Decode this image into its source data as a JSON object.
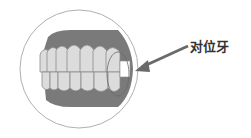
{
  "diagram": {
    "label": "对位牙",
    "colors": {
      "gum": "#7a7a7a",
      "tooth": "#dcdcdc",
      "tooth_outline": "#8a8a8a",
      "circle": "#b0b0b0",
      "arrow": "#6a6a6a",
      "highlight": "#ffffff"
    }
  }
}
